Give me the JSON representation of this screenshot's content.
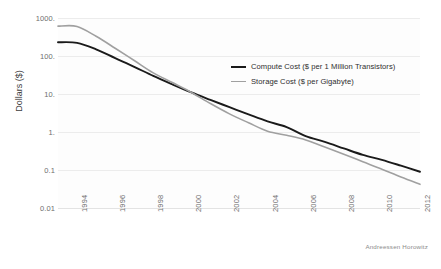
{
  "chart_data": {
    "type": "line",
    "title": "",
    "xlabel": "",
    "ylabel": "Dollars ($)",
    "yscale": "log",
    "ylim": [
      0.01,
      1000
    ],
    "xlim": [
      1993,
      2012
    ],
    "grid": true,
    "legend_position": "center-right",
    "y_ticks": [
      "1000.",
      "100.",
      "10.",
      "1.",
      "0.1",
      "0.01"
    ],
    "y_tick_values": [
      1000,
      100,
      10,
      1,
      0.1,
      0.01
    ],
    "x_ticks": [
      "1994",
      "1996",
      "1998",
      "2000",
      "2002",
      "2004",
      "2006",
      "2008",
      "2010",
      "2012"
    ],
    "x_tick_values": [
      1994,
      1996,
      1998,
      2000,
      2002,
      2004,
      2006,
      2008,
      2010,
      2012
    ],
    "x": [
      1993,
      1994,
      1995,
      1996,
      1997,
      1998,
      1999,
      2000,
      2001,
      2002,
      2003,
      2004,
      2005,
      2006,
      2007,
      2008,
      2009,
      2010,
      2011,
      2012
    ],
    "series": [
      {
        "name": "Compute Cost ($ per 1 Million Transistors)",
        "color": "#1a1a1a",
        "style": "solid",
        "values": [
          230,
          222,
          150,
          88,
          52,
          30,
          18,
          11,
          7.0,
          4.5,
          2.9,
          1.9,
          1.35,
          0.78,
          0.55,
          0.37,
          0.25,
          0.185,
          0.13,
          0.09
        ]
      },
      {
        "name": "Storage Cost ($ per Gigabyte)",
        "color": "#a0a0a0",
        "style": "solid",
        "values": [
          610,
          600,
          330,
          160,
          76,
          36,
          20,
          11,
          5.6,
          3.0,
          1.75,
          1.05,
          0.82,
          0.62,
          0.4,
          0.26,
          0.165,
          0.105,
          0.065,
          0.042
        ]
      }
    ],
    "annotations": [
      {
        "name": "credit",
        "text": "Andreessen Horowitz"
      }
    ]
  },
  "legend": {
    "items": [
      {
        "label": "Compute Cost ($ per 1 Million Transistors)",
        "color": "#1a1a1a"
      },
      {
        "label": "Storage Cost ($ per Gigabyte)",
        "color": "#a0a0a0"
      }
    ]
  },
  "credit": "Andreessen Horowitz",
  "axis": {
    "y_title": "Dollars ($)"
  }
}
